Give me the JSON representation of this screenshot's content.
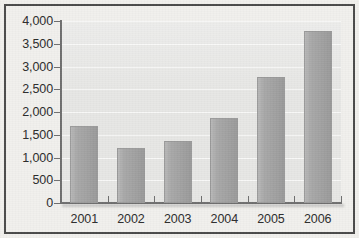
{
  "chart_data": {
    "type": "bar",
    "title": "",
    "subtitle": "",
    "xlabel": "",
    "ylabel": "",
    "categories": [
      "2001",
      "2002",
      "2003",
      "2004",
      "2005",
      "2006"
    ],
    "values": [
      1700,
      1200,
      1370,
      1870,
      2760,
      3790
    ],
    "series": [
      {
        "name": "",
        "values": [
          1700,
          1200,
          1370,
          1870,
          2760,
          3790
        ]
      }
    ],
    "ylim": [
      0,
      4000
    ],
    "ytick_values": [
      0,
      500,
      1000,
      1500,
      2000,
      2500,
      3000,
      3500,
      4000
    ],
    "ytick_labels": [
      "0",
      "500",
      "1,000",
      "1,500",
      "2,000",
      "2,500",
      "3,000",
      "3,500",
      "4,000"
    ],
    "grid": true,
    "grid_axis": "y",
    "legend": false,
    "legend_position": "none",
    "annotations": []
  },
  "style": {
    "bar_color": "#a3a3a3",
    "bar_edge_color": "#9a9a9a",
    "plot_background": "#e7e7e5",
    "page_background": "#f1f0ed",
    "frame_color": "#4a4a4a",
    "axis_color": "#6f6f6f",
    "gridline_color": "#fafafa",
    "text_color": "#2b2b2b"
  }
}
